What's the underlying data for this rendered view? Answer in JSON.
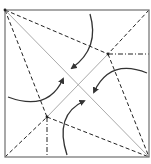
{
  "diagram": {
    "colors": {
      "frame": "#7a7a7a",
      "crease_dark": "#222222",
      "crease_light": "#aaaaaa",
      "arrow": "#333333",
      "background": "#ffffff"
    },
    "frame": {
      "x1": 5,
      "y1": 10,
      "x2": 149,
      "y2": 157
    },
    "nodes": {
      "top_left": [
        5,
        10
      ],
      "top_right": [
        149,
        10
      ],
      "bottom_left": [
        5,
        157
      ],
      "bottom_right": [
        149,
        157
      ],
      "upper_node": [
        108,
        54
      ],
      "lower_node": [
        47,
        117
      ]
    },
    "lines": [
      {
        "name": "main-diagonal",
        "style": "solid-light",
        "from": [
          5,
          10
        ],
        "to": [
          149,
          157
        ]
      },
      {
        "name": "anti-diagonal-segment",
        "style": "solid-light",
        "from": [
          47,
          117
        ],
        "to": [
          108,
          54
        ]
      },
      {
        "name": "tl-to-upper-node",
        "style": "dashed",
        "from": [
          5,
          10
        ],
        "to": [
          108,
          54
        ]
      },
      {
        "name": "tr-to-upper-node",
        "style": "dashed",
        "from": [
          149,
          10
        ],
        "to": [
          108,
          54
        ]
      },
      {
        "name": "upper-node-to-br",
        "style": "dashed",
        "from": [
          108,
          54
        ],
        "to": [
          149,
          157
        ]
      },
      {
        "name": "tl-to-lower-node",
        "style": "dashed",
        "from": [
          5,
          10
        ],
        "to": [
          47,
          117
        ]
      },
      {
        "name": "bl-to-lower-node",
        "style": "dashed",
        "from": [
          5,
          157
        ],
        "to": [
          47,
          117
        ]
      },
      {
        "name": "lower-node-to-br",
        "style": "dashed",
        "from": [
          47,
          117
        ],
        "to": [
          149,
          157
        ]
      },
      {
        "name": "upper-node-to-right-edge",
        "style": "dash-dot",
        "from": [
          108,
          54
        ],
        "to": [
          149,
          54
        ]
      },
      {
        "name": "lower-node-to-bottom-edge",
        "style": "dash-dot",
        "from": [
          47,
          117
        ],
        "to": [
          47,
          157
        ]
      }
    ],
    "arrows": [
      {
        "name": "top-fold-arrow",
        "path": "M90 14 Q100 48 72 68"
      },
      {
        "name": "right-fold-arrow",
        "path": "M147 73 Q110 58 94 92"
      },
      {
        "name": "left-fold-arrow",
        "path": "M8 97 Q48 112 63 79"
      },
      {
        "name": "bottom-fold-arrow",
        "path": "M67 155 Q54 115 84 101"
      }
    ]
  }
}
